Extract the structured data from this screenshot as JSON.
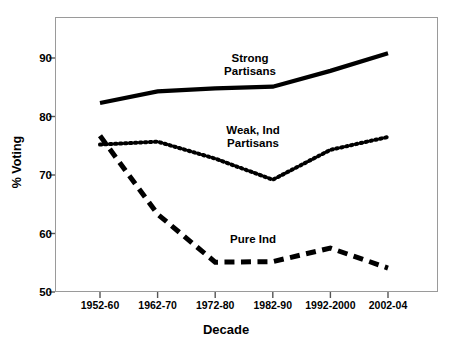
{
  "chart_data": {
    "type": "line",
    "title": "",
    "xlabel": "Decade",
    "ylabel": "% Voting",
    "categories": [
      "1952-60",
      "1962-70",
      "1972-80",
      "1982-90",
      "1992-2000",
      "2002-04"
    ],
    "ylim": [
      46,
      95
    ],
    "yticks": [
      50,
      60,
      70,
      80,
      90
    ],
    "ytick_labels": [
      "50",
      "60",
      "70",
      "80",
      "90"
    ],
    "grid": false,
    "legend_position": "inline-annotations",
    "series": [
      {
        "name": "Strong Partisans",
        "label": "Strong\nPartisans",
        "style": "solid",
        "color": "#000000",
        "values": [
          82.3,
          84.3,
          84.8,
          85.1,
          87.8,
          90.8
        ]
      },
      {
        "name": "Weak, Ind Partisans",
        "label": "Weak, Ind\nPartisans",
        "style": "dotted",
        "color": "#000000",
        "values": [
          75.2,
          75.7,
          72.8,
          69.2,
          74.3,
          76.5
        ]
      },
      {
        "name": "Pure Ind",
        "label": "Pure Ind",
        "style": "dashed",
        "color": "#000000",
        "values": [
          76.7,
          63.3,
          55.1,
          55.2,
          57.5,
          54.1
        ]
      }
    ]
  },
  "axes": {
    "y_title": "% Voting",
    "x_title": "Decade"
  }
}
